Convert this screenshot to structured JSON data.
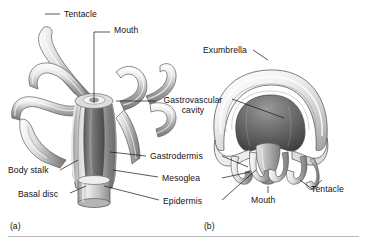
{
  "figure": {
    "type": "scientific-illustration",
    "style": "grayscale airbrush textbook diagram",
    "background_color": "#ffffff",
    "line_color": "#111111"
  },
  "panels": [
    {
      "id": "(a)",
      "name": "polyp",
      "x": 10,
      "y": 221
    },
    {
      "id": "(b)",
      "name": "medusa",
      "x": 204,
      "y": 221
    }
  ],
  "labels": [
    {
      "key": "tentacle_a",
      "text": "Tentacle",
      "x": 64,
      "y": 10,
      "panel": "a"
    },
    {
      "key": "mouth_a",
      "text": "Mouth",
      "x": 114,
      "y": 26,
      "panel": "a"
    },
    {
      "key": "gastro_cav",
      "text": "Gastrovascular cavity",
      "x": 160,
      "y": 96,
      "panel": "both",
      "wrap": true,
      "width": 66
    },
    {
      "key": "gastrodermis",
      "text": "Gastrodermis",
      "x": 150,
      "y": 152,
      "panel": "both"
    },
    {
      "key": "mesoglea",
      "text": "Mesoglea",
      "x": 162,
      "y": 174,
      "panel": "both"
    },
    {
      "key": "epidermis",
      "text": "Epidermis",
      "x": 163,
      "y": 197,
      "panel": "both"
    },
    {
      "key": "body_stalk",
      "text": "Body stalk",
      "x": 8,
      "y": 166,
      "panel": "a"
    },
    {
      "key": "basal_disc",
      "text": "Basal disc",
      "x": 18,
      "y": 190,
      "panel": "a"
    },
    {
      "key": "exumbrella",
      "text": "Exumbrella",
      "x": 203,
      "y": 46,
      "panel": "b"
    },
    {
      "key": "mouth_b",
      "text": "Mouth",
      "x": 251,
      "y": 196,
      "panel": "b"
    },
    {
      "key": "tentacle_b",
      "text": "Tentacle",
      "x": 311,
      "y": 185,
      "panel": "b"
    }
  ],
  "colors": {
    "outline": "#4a4a4a",
    "tissue_light": "#f2f2f2",
    "tissue_mid": "#b4b4b4",
    "tissue_dark": "#6e6e6e",
    "cavity_dark": "#454545",
    "rule": "#b9b9b9"
  }
}
